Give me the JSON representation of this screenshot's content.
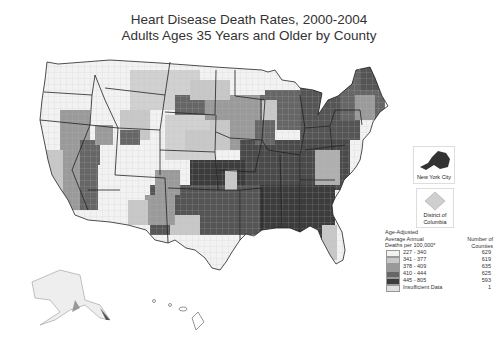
{
  "header": {
    "title_line1": "Heart Disease Death Rates, 2000-2004",
    "title_line2": "Adults Ages 35 Years and Older by County"
  },
  "insets": {
    "nyc_label": "New York City",
    "dc_label_line1": "District of",
    "dc_label_line2": "Columbia"
  },
  "legend": {
    "title_line1": "Age-Adjusted",
    "title_line2": "Average Annual",
    "title_line3": "Deaths per 100,000*",
    "count_header_line1": "Number of",
    "count_header_line2": "Counties",
    "classes": [
      {
        "range": "227 - 340",
        "count": "629",
        "color": "#f2f2f2"
      },
      {
        "range": "341 - 377",
        "count": "619",
        "color": "#c8c8c8"
      },
      {
        "range": "378 - 409",
        "count": "635",
        "color": "#9a9a9a"
      },
      {
        "range": "410 - 444",
        "count": "625",
        "color": "#666666"
      },
      {
        "range": "445 - 805",
        "count": "593",
        "color": "#3c3c3c"
      },
      {
        "range": "Insufficient Data",
        "count": "1",
        "color": "#e0e0e0"
      }
    ]
  },
  "colors": {
    "state_border": "#222222",
    "background": "#ffffff"
  }
}
